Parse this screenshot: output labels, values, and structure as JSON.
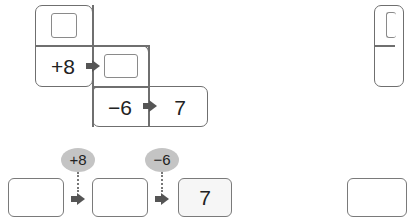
{
  "diagram_top": {
    "top_cell": {
      "answer_box": ""
    },
    "row1": {
      "operator": "+8",
      "answer_box": ""
    },
    "row2": {
      "operator": "−6",
      "result": "7"
    }
  },
  "diagram_bottom": {
    "boxes": [
      "",
      "",
      "7"
    ],
    "operators": [
      "+8",
      "−6"
    ]
  },
  "colors": {
    "border": "#6f6f6f",
    "arrow": "#555555",
    "bubble": "#c4c4c4"
  }
}
